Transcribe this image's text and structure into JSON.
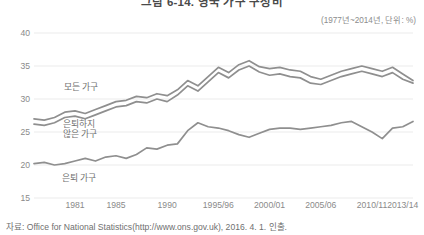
{
  "chart_data": {
    "type": "line",
    "title": "그림 6-14. 영국 가구 구성비",
    "subtitle": "(1977년~2014년, 단위: %)",
    "source": "자료: Office for National Statistics(http://www.ons.gov.uk), 2016. 4. 1. 인출.",
    "xlabel": "",
    "ylabel": "",
    "ylim": [
      15,
      40
    ],
    "yticks": [
      40,
      35,
      30,
      25,
      20,
      15
    ],
    "xtick_labels": [
      "1981",
      "1985",
      "1990",
      "1995/96",
      "2000/01",
      "2005/06",
      "2010/11",
      "2013/14"
    ],
    "xtick_years": [
      1981,
      1985,
      1990,
      1995,
      2000,
      2005,
      2010,
      2013
    ],
    "xlim": [
      1977,
      2014
    ],
    "grid": true,
    "legend": "inline-labels",
    "line_color": "#8f8f8f",
    "grid_color": "#ebebeb",
    "x": [
      1977,
      1978,
      1979,
      1980,
      1981,
      1982,
      1983,
      1984,
      1985,
      1986,
      1987,
      1988,
      1989,
      1990,
      1991,
      1992,
      1993,
      1994,
      1995,
      1996,
      1997,
      1998,
      1999,
      2000,
      2001,
      2002,
      2003,
      2004,
      2005,
      2006,
      2007,
      2008,
      2009,
      2010,
      2011,
      2012,
      2013,
      2014
    ],
    "series": [
      {
        "name": "모든 가구",
        "label": "모든 가구",
        "values": [
          27.0,
          26.8,
          27.2,
          28.0,
          28.2,
          27.8,
          28.4,
          29.0,
          29.6,
          29.8,
          30.4,
          30.2,
          30.8,
          30.5,
          31.4,
          32.8,
          32.0,
          33.4,
          34.8,
          34.0,
          35.2,
          35.8,
          34.9,
          34.6,
          34.8,
          34.4,
          34.2,
          33.4,
          33.0,
          33.6,
          34.2,
          34.6,
          35.0,
          34.6,
          34.2,
          34.8,
          33.8,
          32.8
        ]
      },
      {
        "name": "은퇴하지 않은 가구",
        "label": "은퇴하지\n않은 가구",
        "values": [
          26.2,
          26.0,
          26.4,
          27.2,
          27.4,
          27.0,
          27.6,
          28.2,
          28.8,
          29.0,
          29.6,
          29.4,
          30.0,
          29.6,
          30.6,
          32.0,
          31.2,
          32.6,
          34.0,
          33.2,
          34.4,
          35.0,
          34.1,
          33.6,
          33.8,
          33.4,
          33.2,
          32.4,
          32.2,
          32.8,
          33.4,
          33.8,
          34.2,
          33.8,
          33.4,
          34.0,
          33.0,
          32.4
        ]
      },
      {
        "name": "은퇴 가구",
        "label": "은퇴 가구",
        "values": [
          20.2,
          20.4,
          20.0,
          20.2,
          20.6,
          21.0,
          20.6,
          21.2,
          21.4,
          21.0,
          21.6,
          22.6,
          22.4,
          23.0,
          23.2,
          25.2,
          26.4,
          25.8,
          25.6,
          25.2,
          24.6,
          24.2,
          24.8,
          25.4,
          25.6,
          25.6,
          25.4,
          25.6,
          25.8,
          26.0,
          26.4,
          26.6,
          25.8,
          25.0,
          24.0,
          25.6,
          25.8,
          26.6
        ]
      }
    ]
  }
}
